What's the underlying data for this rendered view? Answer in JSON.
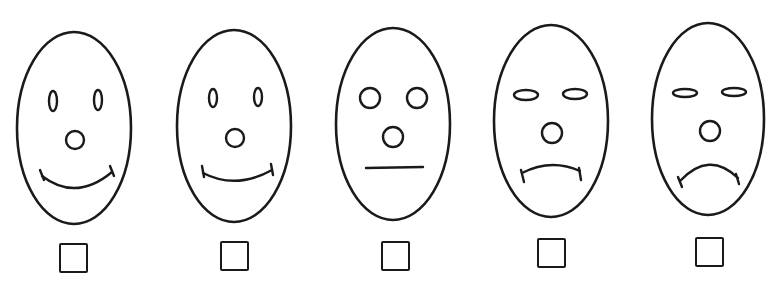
{
  "stroke_color": "#1a1a1a",
  "background": "#ffffff",
  "faces": [
    {
      "label": "very happy",
      "head": {
        "cx": 74,
        "cy": 128,
        "rx": 57,
        "ry": 96
      },
      "eyes": {
        "type": "vertical-oval",
        "left": {
          "cx": 53,
          "cy": 101,
          "rx": 4,
          "ry": 10
        },
        "right": {
          "cx": 98,
          "cy": 100,
          "rx": 4,
          "ry": 10
        }
      },
      "nose": {
        "cx": 75,
        "cy": 140,
        "r": 9
      },
      "mouth": {
        "type": "smile",
        "path": "M42 176 Q76 202 112 172",
        "ticks": [
          [
            40,
            170,
            44,
            180
          ],
          [
            110,
            166,
            114,
            176
          ]
        ]
      },
      "checkbox": {
        "x": 59,
        "y": 243,
        "checked": false
      }
    },
    {
      "label": "happy",
      "head": {
        "cx": 234,
        "cy": 126,
        "rx": 57,
        "ry": 96
      },
      "eyes": {
        "type": "vertical-oval",
        "left": {
          "cx": 213,
          "cy": 98,
          "rx": 4,
          "ry": 9
        },
        "right": {
          "cx": 258,
          "cy": 97,
          "rx": 4,
          "ry": 9
        }
      },
      "nose": {
        "cx": 235,
        "cy": 138,
        "r": 9
      },
      "mouth": {
        "type": "smile",
        "path": "M203 173 Q236 190 272 170",
        "ticks": [
          [
            202,
            166,
            204,
            177
          ],
          [
            271,
            164,
            273,
            175
          ]
        ]
      },
      "checkbox": {
        "x": 220,
        "y": 241,
        "checked": false
      }
    },
    {
      "label": "neutral",
      "head": {
        "cx": 393,
        "cy": 124,
        "rx": 57,
        "ry": 96
      },
      "eyes": {
        "type": "circle",
        "left": {
          "cx": 370,
          "cy": 98,
          "rx": 10,
          "ry": 10
        },
        "right": {
          "cx": 417,
          "cy": 98,
          "rx": 10,
          "ry": 10
        }
      },
      "nose": {
        "cx": 393,
        "cy": 137,
        "r": 10
      },
      "mouth": {
        "type": "straight",
        "path": "M366 168 L423 167",
        "ticks": []
      },
      "checkbox": {
        "x": 381,
        "y": 241,
        "checked": false
      }
    },
    {
      "label": "sad",
      "head": {
        "cx": 551,
        "cy": 121,
        "rx": 57,
        "ry": 96
      },
      "eyes": {
        "type": "horizontal-oval",
        "left": {
          "cx": 526,
          "cy": 95,
          "rx": 12,
          "ry": 5
        },
        "right": {
          "cx": 575,
          "cy": 94,
          "rx": 12,
          "ry": 5
        }
      },
      "nose": {
        "cx": 552,
        "cy": 133,
        "r": 10
      },
      "mouth": {
        "type": "frown",
        "path": "M522 173 Q551 158 580 171",
        "ticks": [
          [
            521,
            170,
            524,
            182
          ],
          [
            579,
            168,
            581,
            180
          ]
        ]
      },
      "checkbox": {
        "x": 537,
        "y": 238,
        "checked": false
      }
    },
    {
      "label": "very sad",
      "head": {
        "cx": 708,
        "cy": 119,
        "rx": 56,
        "ry": 96
      },
      "eyes": {
        "type": "horizontal-oval",
        "left": {
          "cx": 685,
          "cy": 93,
          "rx": 12,
          "ry": 4
        },
        "right": {
          "cx": 734,
          "cy": 92,
          "rx": 12,
          "ry": 4
        }
      },
      "nose": {
        "cx": 710,
        "cy": 131,
        "r": 10
      },
      "mouth": {
        "type": "frown",
        "path": "M680 181 Q709 150 738 178",
        "ticks": [
          [
            678,
            177,
            682,
            187
          ],
          [
            736,
            174,
            739,
            184
          ]
        ]
      },
      "checkbox": {
        "x": 695,
        "y": 237,
        "checked": false
      }
    }
  ]
}
